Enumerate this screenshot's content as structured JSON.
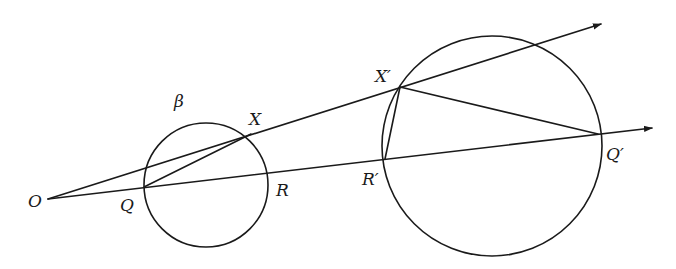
{
  "diagram": {
    "labels": {
      "origin": "O",
      "circle_small": "β",
      "point_Q": "Q",
      "point_X": "X",
      "point_R": "R",
      "point_X_prime": "X′",
      "point_R_prime": "R′",
      "point_Q_prime": "Q′"
    },
    "elements": {
      "rays": [
        "upper ray from O through X and X′",
        "lower ray from O through Q, R, R′ and Q′"
      ],
      "segments": [
        "QX",
        "X′R′",
        "X′Q′"
      ],
      "circles": [
        "β (through Q, X, R)",
        "image circle (through X′, R′, Q′)"
      ]
    },
    "colors": {
      "ink": "#1a1a1a",
      "background": "#ffffff"
    }
  }
}
